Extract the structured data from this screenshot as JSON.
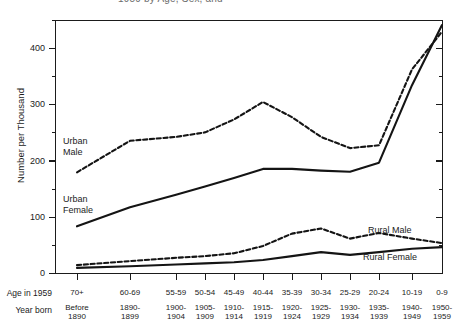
{
  "figure": {
    "title": "1959 by Age, Sex, and",
    "title_note": "cropped-at-top"
  },
  "axes": {
    "y_label": "Number per Thousand",
    "y_ticks": [
      "0",
      "100",
      "200",
      "300",
      "400"
    ],
    "x_row1_header": "Age in 1959",
    "x_row2_header": "Year born"
  },
  "series_labels": {
    "urban_male": "Urban\nMale",
    "urban_male_l1": "Urban",
    "urban_male_l2": "Male",
    "urban_female_l1": "Urban",
    "urban_female_l2": "Female",
    "rural_male": "Rural Male",
    "rural_female": "Rural Female"
  },
  "chart_data": {
    "type": "line",
    "title": "1959 by Age, Sex, and",
    "xlabel": "Age in 1959 / Year born",
    "ylabel": "Number per Thousand",
    "ylim": [
      0,
      450
    ],
    "grid": false,
    "legend": "inline-annotations",
    "categories": [
      "70+",
      "60-69",
      "55-59",
      "50-54",
      "45-49",
      "40-44",
      "35-39",
      "30-34",
      "25-29",
      "20-24",
      "10-19",
      "0-9"
    ],
    "categories_year_born": [
      "Before 1890",
      "1890-1899",
      "1900-1904",
      "1905-1909",
      "1910-1914",
      "1915-1919",
      "1920-1924",
      "1925-1929",
      "1930-1934",
      "1935-1939",
      "1940-1949",
      "1950-1959"
    ],
    "x_positions_px": [
      77,
      130,
      176,
      205,
      234,
      263,
      292,
      321,
      350,
      379,
      412,
      442
    ],
    "series": [
      {
        "name": "Urban Male",
        "style": "dashed",
        "values": [
          180,
          236,
          243,
          251,
          274,
          305,
          278,
          243,
          223,
          228,
          363,
          430
        ]
      },
      {
        "name": "Urban Female",
        "style": "solid",
        "values": [
          84,
          118,
          140,
          155,
          170,
          186,
          186,
          183,
          181,
          197,
          335,
          442
        ]
      },
      {
        "name": "Rural Male",
        "style": "dashed",
        "values": [
          15,
          22,
          28,
          31,
          36,
          49,
          71,
          80,
          62,
          72,
          62,
          54
        ]
      },
      {
        "name": "Rural Female",
        "style": "solid",
        "values": [
          10,
          13,
          16,
          18,
          20,
          24,
          31,
          38,
          33,
          38,
          44,
          47
        ]
      }
    ]
  }
}
